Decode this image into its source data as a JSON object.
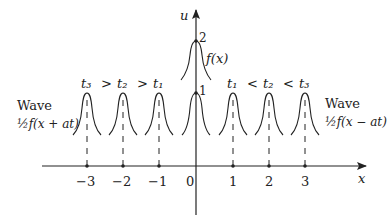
{
  "diagram": {
    "axes": {
      "x_label": "x",
      "u_label": "u",
      "x_ticks": [
        "−3",
        "−2",
        "−1",
        "0",
        "1",
        "2",
        "3"
      ],
      "u_ticks": [
        "1",
        "2"
      ]
    },
    "initial": {
      "label": "f(x)",
      "peak": "2"
    },
    "left_wave": {
      "title": "Wave",
      "expr": "½f(x + at)",
      "times": [
        "t₃",
        ">",
        "t₂",
        ">",
        "t₁"
      ]
    },
    "right_wave": {
      "title": "Wave",
      "expr": "½f(x − at)",
      "times": [
        "t₁",
        "<",
        "t₂",
        "<",
        "t₃"
      ]
    }
  }
}
